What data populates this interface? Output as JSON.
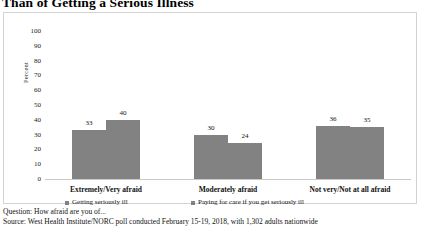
{
  "title": "Than of Getting a Serious Illness",
  "footnotes": {
    "question": "Question: How afraid are you of...",
    "source": "Source: West Health Institute/NORC poll conducted February 15-19, 2018, with 1,302 adults nationwide"
  },
  "colors": {
    "bar": "#828282",
    "panel_border": "#d2d2d2",
    "axis": "#c8c8c8"
  },
  "chart_data": {
    "type": "bar",
    "title": "Than of Getting a Serious Illness",
    "xlabel": "",
    "ylabel": "Percent",
    "ylim": [
      0,
      100
    ],
    "yticks": [
      100,
      90,
      80,
      70,
      60,
      50,
      40,
      30,
      20,
      10,
      0
    ],
    "grid": false,
    "legend_position": "bottom",
    "categories": [
      "Extremely/Very afraid",
      "Moderately afraid",
      "Not very/Not at all afraid"
    ],
    "series": [
      {
        "name": "Getting seriously ill",
        "values": [
          33,
          30,
          36
        ]
      },
      {
        "name": "Paying for care if you get seriously ill",
        "values": [
          40,
          24,
          35
        ]
      }
    ]
  }
}
